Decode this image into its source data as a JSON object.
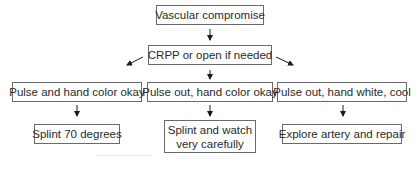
{
  "diagram": {
    "nodes": {
      "root": "Vascular compromise",
      "step": "CRPP or open if needed",
      "cond_left": "Pulse and hand color okay",
      "cond_mid": "Pulse out, hand color okay",
      "cond_right": "Pulse out, hand white, cool",
      "act_left": "Splint 70 degrees",
      "act_mid_1": "Splint and watch",
      "act_mid_2": "very carefully",
      "act_right": "Explore artery and repair"
    },
    "edges": [
      [
        "root",
        "step"
      ],
      [
        "step",
        "cond_left"
      ],
      [
        "step",
        "cond_mid"
      ],
      [
        "step",
        "cond_right"
      ],
      [
        "cond_left",
        "act_left"
      ],
      [
        "cond_mid",
        "act_mid"
      ],
      [
        "cond_right",
        "act_right"
      ]
    ]
  }
}
